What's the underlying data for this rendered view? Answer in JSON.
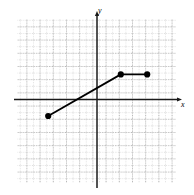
{
  "figure": {
    "type": "coordinate-plane-graph",
    "width": 194,
    "height": 195,
    "background_color": "#ffffff"
  },
  "axes": {
    "x_label": "x",
    "y_label": "y",
    "axis_color": "#1a1a1a",
    "x_axis_pixel_y": 99.5,
    "y_axis_pixel_x": 97,
    "has_arrow_x_positive": true,
    "has_arrow_y_positive": true
  },
  "grid": {
    "visible": true,
    "style": "dotted",
    "minor_color": "#b8b8b8",
    "major_color": "#8a8a8a",
    "minor_spacing_px": 6.6,
    "major_every_n_minor": 2,
    "left_px": 17,
    "right_px": 176,
    "top_px": 19,
    "bottom_px": 183
  },
  "chart_data": {
    "type": "line",
    "title": "",
    "xlabel": "x",
    "ylabel": "y",
    "grid": true,
    "legend": "none",
    "xlim": [
      -6,
      6
    ],
    "ylim": [
      -6,
      6.2
    ],
    "x": [
      -3.7,
      1.8,
      3.8
    ],
    "y": [
      -1.25,
      1.9,
      1.9
    ],
    "series": [
      {
        "name": "piecewise-path",
        "points": [
          {
            "x": -3.7,
            "y": -1.25
          },
          {
            "x": 1.8,
            "y": 1.9
          },
          {
            "x": 3.8,
            "y": 1.9
          }
        ],
        "line_color": "#000000",
        "line_width": 1.8,
        "marker": "filled-circle",
        "marker_radius": 3.1,
        "marker_color": "#000000"
      }
    ],
    "xticklabels": [],
    "yticklabels": [],
    "annotations": []
  }
}
